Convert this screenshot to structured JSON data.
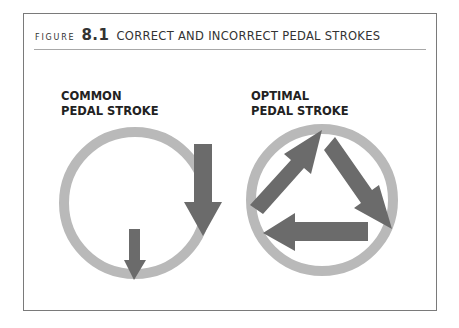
{
  "figure": {
    "prefix": "FIGURE",
    "number": "8.1",
    "title": "CORRECT AND INCORRECT PEDAL STROKES"
  },
  "panels": [
    {
      "line1": "COMMON",
      "line2": "PEDAL STROKE",
      "description": "circle with two downward arrows"
    },
    {
      "line1": "OPTIMAL",
      "line2": "PEDAL STROKE",
      "description": "circle with three arrows forming a clockwise triangle"
    }
  ],
  "colors": {
    "ring": "#b9b9b9",
    "arrow": "#6b6b6b",
    "border": "#7a7a7a",
    "text": "#333333"
  }
}
